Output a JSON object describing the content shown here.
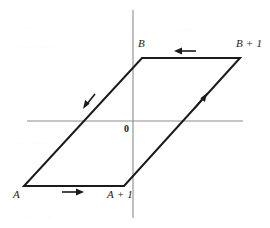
{
  "figure": {
    "background_color": "#ffffff",
    "stroke_color": "#1a1a1a",
    "axis_color": "#8c8c8c",
    "title": "",
    "caption": ""
  },
  "axes": {
    "origin_label": "0",
    "origin_x": 133,
    "origin_y": 121,
    "x_axis": {
      "x1": 27,
      "y1": 121,
      "x2": 243,
      "y2": 121,
      "label": ""
    },
    "y_axis": {
      "x1": 133,
      "y1": 10,
      "x2": 133,
      "y2": 218,
      "label": ""
    }
  },
  "chart_data": {
    "type": "line",
    "title": "",
    "xlabel": "",
    "ylabel": "",
    "grid": false,
    "legend": "none",
    "shape": "parallelogram",
    "closed": true,
    "vertices": [
      {
        "name": "A",
        "label": "A",
        "x": 24,
        "y": 186
      },
      {
        "name": "A_plus_1",
        "label": "A + 1",
        "x": 124,
        "y": 186
      },
      {
        "name": "B_plus_1",
        "label": "B + 1",
        "x": 240,
        "y": 58
      },
      {
        "name": "B",
        "label": "B",
        "x": 142,
        "y": 58
      }
    ],
    "edges": [
      {
        "from": "A",
        "to": "A_plus_1",
        "direction": "right",
        "arrow_at": 0.45
      },
      {
        "from": "A_plus_1",
        "to": "B_plus_1",
        "direction": "up-right",
        "arrow_at": 0.52
      },
      {
        "from": "B_plus_1",
        "to": "B",
        "direction": "left",
        "arrow_at": 0.45
      },
      {
        "from": "B",
        "to": "A",
        "direction": "down-left",
        "arrow_at": 0.52
      }
    ]
  },
  "labels": {
    "B": "B",
    "B_plus_1": "B + 1",
    "A": "A",
    "A_plus_1": "A + 1",
    "origin": "0"
  },
  "arrows": [
    {
      "name": "arrow-bottom-right",
      "points": "right",
      "x": 72,
      "y": 192
    },
    {
      "name": "arrow-right-diagonal",
      "points": "up-right",
      "x": 199,
      "y": 101
    },
    {
      "name": "arrow-top-left",
      "points": "left",
      "x": 188,
      "y": 51
    },
    {
      "name": "arrow-left-diagonal",
      "points": "down-left",
      "x": 90,
      "y": 100
    }
  ]
}
